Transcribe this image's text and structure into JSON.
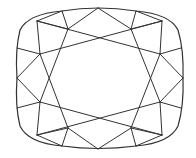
{
  "diagram": {
    "stroke_color": "#333333",
    "background": "#ffffff",
    "outline": {
      "x": 17,
      "y": 8,
      "width": 166,
      "height": 141
    },
    "lines": [
      [
        98,
        8,
        68,
        29
      ],
      [
        98,
        8,
        131,
        29
      ],
      [
        62,
        11,
        68,
        29
      ],
      [
        136,
        11,
        131,
        29
      ],
      [
        37,
        21,
        68,
        29
      ],
      [
        162,
        21,
        131,
        29
      ],
      [
        37,
        21,
        160,
        54
      ],
      [
        162,
        21,
        40,
        54
      ],
      [
        37,
        21,
        40,
        54
      ],
      [
        162,
        21,
        160,
        54
      ],
      [
        62,
        11,
        37,
        21
      ],
      [
        136,
        11,
        162,
        21
      ],
      [
        17,
        48,
        40,
        54
      ],
      [
        181,
        48,
        160,
        54
      ],
      [
        68,
        29,
        40,
        102
      ],
      [
        131,
        29,
        160,
        102
      ],
      [
        40,
        54,
        17,
        78
      ],
      [
        160,
        54,
        183,
        78
      ],
      [
        17,
        78,
        40,
        102
      ],
      [
        183,
        78,
        160,
        102
      ],
      [
        40,
        54,
        68,
        128
      ],
      [
        160,
        54,
        131,
        128
      ],
      [
        17,
        108,
        40,
        102
      ],
      [
        181,
        108,
        160,
        102
      ],
      [
        37,
        135,
        40,
        102
      ],
      [
        162,
        135,
        160,
        102
      ],
      [
        37,
        135,
        160,
        102
      ],
      [
        162,
        135,
        40,
        102
      ],
      [
        37,
        135,
        68,
        128
      ],
      [
        162,
        135,
        131,
        128
      ],
      [
        62,
        146,
        68,
        128
      ],
      [
        136,
        146,
        131,
        128
      ],
      [
        62,
        146,
        37,
        135
      ],
      [
        136,
        146,
        162,
        135
      ],
      [
        98,
        149,
        68,
        128
      ],
      [
        98,
        149,
        131,
        128
      ]
    ]
  }
}
